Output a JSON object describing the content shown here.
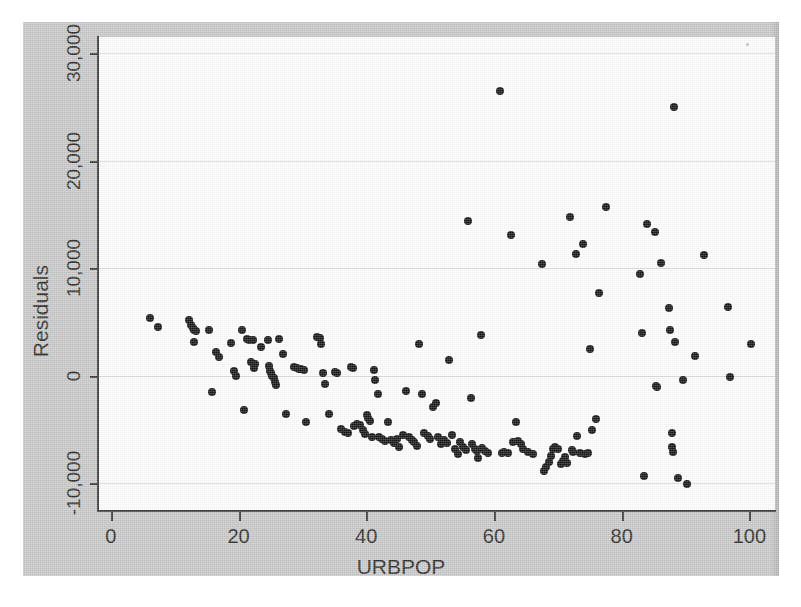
{
  "figure": {
    "panel_color": "#c9c9c9",
    "plot_background": "#ffffff",
    "gridline_color": "#dedede",
    "axis_color": "#3a3a3a",
    "marker_color": "#151515"
  },
  "chart_data": {
    "type": "scatter",
    "title": "",
    "xlabel": "URBPOP",
    "ylabel": "Residuals",
    "xlim": [
      -2,
      104
    ],
    "ylim": [
      -12500,
      31500
    ],
    "xticks": [
      0,
      20,
      40,
      60,
      80,
      100
    ],
    "xtick_labels": [
      "0",
      "20",
      "40",
      "60",
      "80",
      "100"
    ],
    "yticks": [
      -10000,
      0,
      10000,
      20000,
      30000
    ],
    "ytick_labels": [
      "-10,000",
      "0",
      "10,000",
      "20,000",
      "30,000"
    ],
    "grid": "horizontal",
    "legend": "none",
    "marker": "filled-circle",
    "n_points": 163,
    "points": [
      [
        6.1,
        5400
      ],
      [
        7.4,
        4500
      ],
      [
        12.2,
        5200
      ],
      [
        12.6,
        4700
      ],
      [
        12.8,
        4450
      ],
      [
        13.0,
        4250
      ],
      [
        13.3,
        4150
      ],
      [
        13.1,
        3100
      ],
      [
        15.4,
        4250
      ],
      [
        15.8,
        -1500
      ],
      [
        16.5,
        2200
      ],
      [
        17.0,
        1700
      ],
      [
        18.9,
        3000
      ],
      [
        19.3,
        450
      ],
      [
        19.6,
        0
      ],
      [
        20.5,
        4200
      ],
      [
        20.9,
        -3200
      ],
      [
        21.4,
        3400
      ],
      [
        21.7,
        3300
      ],
      [
        21.9,
        1300
      ],
      [
        22.3,
        3350
      ],
      [
        22.6,
        1100
      ],
      [
        22.4,
        700
      ],
      [
        23.5,
        2700
      ],
      [
        24.6,
        3300
      ],
      [
        24.8,
        900
      ],
      [
        24.9,
        400
      ],
      [
        25.1,
        200
      ],
      [
        25.3,
        0
      ],
      [
        25.5,
        -200
      ],
      [
        25.7,
        -600
      ],
      [
        25.9,
        -900
      ],
      [
        26.4,
        3400
      ],
      [
        27.0,
        2000
      ],
      [
        27.5,
        -3600
      ],
      [
        28.7,
        800
      ],
      [
        29.1,
        700
      ],
      [
        29.4,
        650
      ],
      [
        29.8,
        600
      ],
      [
        30.2,
        550
      ],
      [
        30.6,
        -4300
      ],
      [
        32.3,
        3600
      ],
      [
        32.7,
        3500
      ],
      [
        32.9,
        2900
      ],
      [
        33.3,
        200
      ],
      [
        33.6,
        -800
      ],
      [
        34.2,
        -3600
      ],
      [
        35.1,
        300
      ],
      [
        35.4,
        200
      ],
      [
        36.0,
        -5000
      ],
      [
        36.6,
        -5200
      ],
      [
        37.2,
        -5300
      ],
      [
        37.6,
        800
      ],
      [
        38.0,
        700
      ],
      [
        38.1,
        -4700
      ],
      [
        38.6,
        -4500
      ],
      [
        39.0,
        -4600
      ],
      [
        39.5,
        -5100
      ],
      [
        39.8,
        -5400
      ],
      [
        40.1,
        -3700
      ],
      [
        40.3,
        -3900
      ],
      [
        40.6,
        -4200
      ],
      [
        40.9,
        -5700
      ],
      [
        41.2,
        500
      ],
      [
        41.4,
        -400
      ],
      [
        41.8,
        -1700
      ],
      [
        42.0,
        -5700
      ],
      [
        42.4,
        -5900
      ],
      [
        42.9,
        -6100
      ],
      [
        43.4,
        -4300
      ],
      [
        43.9,
        -6000
      ],
      [
        44.3,
        -6300
      ],
      [
        44.8,
        -5900
      ],
      [
        45.2,
        -6600
      ],
      [
        45.8,
        -5500
      ],
      [
        46.3,
        -1400
      ],
      [
        46.7,
        -5700
      ],
      [
        47.1,
        -6000
      ],
      [
        47.5,
        -6200
      ],
      [
        47.9,
        -6500
      ],
      [
        48.3,
        2900
      ],
      [
        48.7,
        -1700
      ],
      [
        49.1,
        -5300
      ],
      [
        49.6,
        -5600
      ],
      [
        50.0,
        -5900
      ],
      [
        50.5,
        -2900
      ],
      [
        50.9,
        -2500
      ],
      [
        51.3,
        -5700
      ],
      [
        51.7,
        -6400
      ],
      [
        52.1,
        -6000
      ],
      [
        52.6,
        -6300
      ],
      [
        53.0,
        1500
      ],
      [
        53.4,
        -5500
      ],
      [
        53.9,
        -6800
      ],
      [
        54.3,
        -7300
      ],
      [
        54.7,
        -6200
      ],
      [
        55.2,
        -6600
      ],
      [
        55.6,
        -6900
      ],
      [
        56.0,
        14400
      ],
      [
        56.4,
        -2100
      ],
      [
        56.6,
        -6400
      ],
      [
        57.0,
        -6800
      ],
      [
        57.3,
        -7000
      ],
      [
        57.5,
        -7700
      ],
      [
        57.9,
        3800
      ],
      [
        58.2,
        -6700
      ],
      [
        58.6,
        -7000
      ],
      [
        59.0,
        -7200
      ],
      [
        60.9,
        26500
      ],
      [
        61.2,
        -7200
      ],
      [
        61.6,
        -7100
      ],
      [
        62.2,
        -7200
      ],
      [
        62.6,
        13100
      ],
      [
        63.0,
        -6200
      ],
      [
        63.4,
        -4300
      ],
      [
        63.8,
        -6100
      ],
      [
        64.2,
        -6400
      ],
      [
        64.6,
        -6800
      ],
      [
        65.3,
        -7100
      ],
      [
        66.1,
        -7300
      ],
      [
        67.5,
        10400
      ],
      [
        67.8,
        -8900
      ],
      [
        68.2,
        -8500
      ],
      [
        68.6,
        -8000
      ],
      [
        68.9,
        -7500
      ],
      [
        69.3,
        -6800
      ],
      [
        69.6,
        -6600
      ],
      [
        70.1,
        -6800
      ],
      [
        70.5,
        -8200
      ],
      [
        70.8,
        -7900
      ],
      [
        71.1,
        -7600
      ],
      [
        71.5,
        -8100
      ],
      [
        71.9,
        14800
      ],
      [
        72.2,
        -6900
      ],
      [
        72.4,
        -7100
      ],
      [
        72.8,
        11300
      ],
      [
        73.0,
        -5600
      ],
      [
        73.4,
        -7200
      ],
      [
        74.0,
        12200
      ],
      [
        74.3,
        -7300
      ],
      [
        74.7,
        -7200
      ],
      [
        75.0,
        2500
      ],
      [
        75.4,
        -5100
      ],
      [
        76.0,
        -4000
      ],
      [
        76.4,
        7700
      ],
      [
        77.6,
        15700
      ],
      [
        82.8,
        9500
      ],
      [
        83.2,
        4000
      ],
      [
        83.5,
        -9300
      ],
      [
        84.0,
        14100
      ],
      [
        85.2,
        13400
      ],
      [
        85.4,
        -1000
      ],
      [
        85.6,
        -1100
      ],
      [
        86.2,
        10500
      ],
      [
        87.4,
        6300
      ],
      [
        87.6,
        4200
      ],
      [
        87.8,
        -5300
      ],
      [
        87.9,
        -6600
      ],
      [
        88.0,
        -7100
      ],
      [
        88.2,
        25000
      ],
      [
        88.4,
        3100
      ],
      [
        88.8,
        -9500
      ],
      [
        89.6,
        -400
      ],
      [
        90.2,
        -10100
      ],
      [
        91.5,
        1800
      ],
      [
        92.9,
        11200
      ],
      [
        96.6,
        6400
      ],
      [
        97.0,
        -100
      ],
      [
        100.2,
        2900
      ]
    ]
  }
}
